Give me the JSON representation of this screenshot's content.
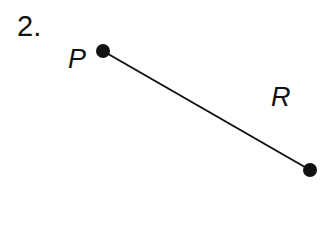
{
  "problem": {
    "number_label": "2.",
    "points": [
      {
        "label": "P",
        "x": 103,
        "y": 51
      },
      {
        "label": "R",
        "x": 310,
        "y": 170
      }
    ],
    "segment": {
      "from": "P",
      "to": "end",
      "color": "#111111"
    }
  }
}
